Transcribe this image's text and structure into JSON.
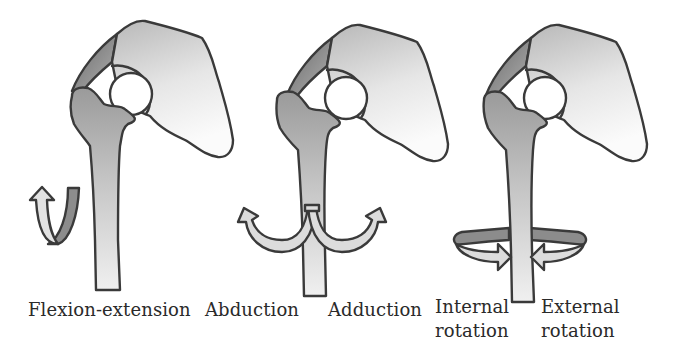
{
  "figure": {
    "panels": [
      {
        "id": "flexion-extension",
        "labels": [
          "Flexion-extension"
        ]
      },
      {
        "id": "abduction-adduction",
        "labels": [
          "Abduction",
          "Adduction"
        ]
      },
      {
        "id": "rotation",
        "labels": [
          "Internal",
          "rotation",
          "External",
          "rotation"
        ]
      }
    ],
    "colors": {
      "outline": "#3a3a3a",
      "bone_dark": "#9a9a9a",
      "bone_light": "#eeeeee",
      "pelvis_light": "#f6f6f6",
      "arrow_light": "#dcdcdc",
      "arrow_dark": "#8c8c8c",
      "text": "#2a2a2a"
    }
  }
}
